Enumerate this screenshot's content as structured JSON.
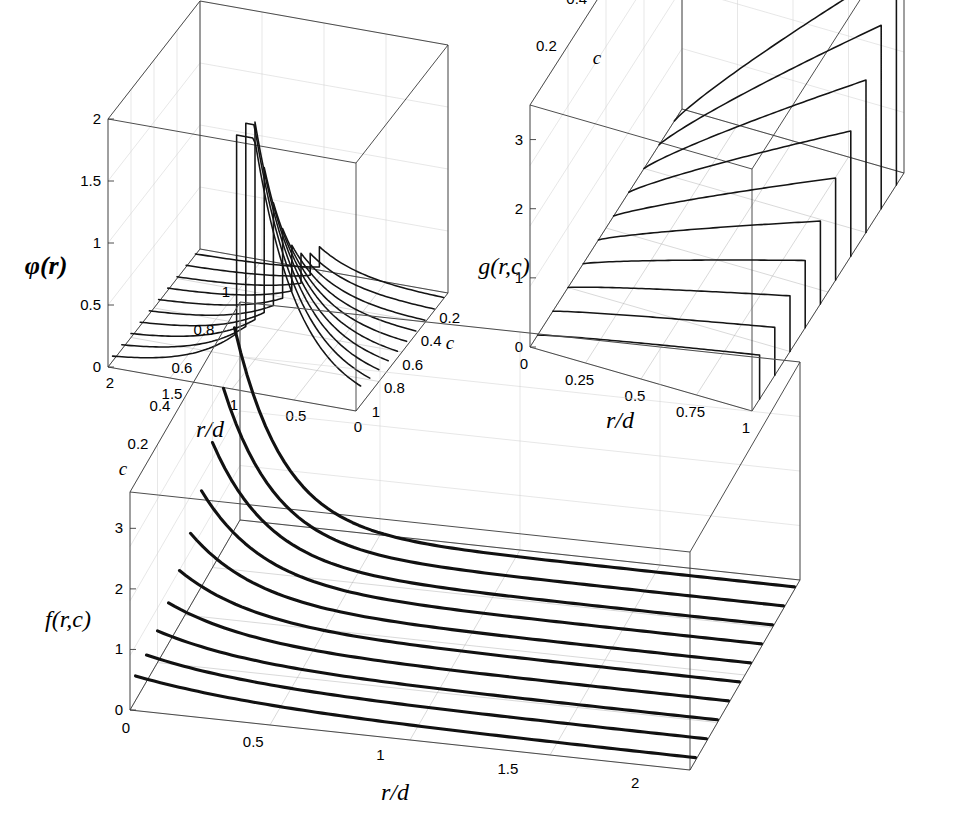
{
  "figure": {
    "kind": "three-panel-3d-line-plot",
    "background": "#ffffff",
    "curve_color": "#141414",
    "frame_color": "#3a3a3a",
    "grid_color": "#b9b9b9"
  },
  "chart_data": [
    {
      "id": "phi",
      "type": "line",
      "title": "",
      "zlabel": "φ(r)",
      "xlabel": "r/d",
      "ylabel": "c",
      "xticks": [
        "2",
        "1.5",
        "1",
        "0.5",
        "0"
      ],
      "xtickvals": [
        2,
        1.5,
        1,
        0.5,
        0
      ],
      "yticks": [
        "0.2",
        "0.4",
        "0.6",
        "0.8",
        "1"
      ],
      "ytickvals": [
        0.2,
        0.4,
        0.6,
        0.8,
        1
      ],
      "zticks": [
        "0",
        "0.5",
        "1",
        "1.5",
        "2"
      ],
      "ztickvals": [
        0,
        0.5,
        1,
        1.5,
        2
      ],
      "xlim": [
        0,
        2
      ],
      "ylim": [
        0,
        1
      ],
      "zlim": [
        0,
        2
      ],
      "x_reversed": true,
      "grid": true,
      "legend": "none",
      "series_param": "c",
      "series_values": [
        0.1,
        0.19,
        0.28,
        0.37,
        0.46,
        0.55,
        0.64,
        0.73,
        0.82,
        0.91
      ],
      "n_curves": 10,
      "note": "step discontinuity at r/d = 1; spike height grows with c"
    },
    {
      "id": "g",
      "type": "line",
      "title": "",
      "zlabel": "g(r,c)",
      "xlabel": "r/d",
      "ylabel": "c",
      "xticks": [
        "0",
        "0.25",
        "0.5",
        "0.75",
        "1"
      ],
      "xtickvals": [
        0,
        0.25,
        0.5,
        0.75,
        1
      ],
      "yticks": [
        "0.2",
        "0.4",
        "0.6",
        "0.8",
        "1"
      ],
      "ytickvals": [
        0.2,
        0.4,
        0.6,
        0.8,
        1
      ],
      "zticks": [
        "0",
        "1",
        "2",
        "3"
      ],
      "ztickvals": [
        0,
        1,
        2,
        3
      ],
      "xlim": [
        0,
        1
      ],
      "ylim": [
        0,
        1
      ],
      "zlim": [
        0,
        3.5
      ],
      "x_reversed": false,
      "grid": true,
      "legend": "none",
      "series_param": "c",
      "series_values": [
        0.1,
        0.19,
        0.28,
        0.37,
        0.46,
        0.55,
        0.64,
        0.73,
        0.82,
        0.91
      ],
      "n_curves": 10,
      "note": "curves rise from origin then drop vertically to 0 at r/d = 1"
    },
    {
      "id": "f",
      "type": "line",
      "title": "",
      "zlabel": "f(r,c)",
      "xlabel": "r/d",
      "ylabel": "c",
      "xticks": [
        "0",
        "0.5",
        "1",
        "1.5",
        "2"
      ],
      "xtickvals": [
        0,
        0.5,
        1,
        1.5,
        2
      ],
      "yticks": [
        "0.2",
        "0.4",
        "0.6",
        "0.8",
        "1"
      ],
      "ytickvals": [
        0.2,
        0.4,
        0.6,
        0.8,
        1
      ],
      "zticks": [
        "0",
        "1",
        "2",
        "3"
      ],
      "ztickvals": [
        0,
        1,
        2,
        3
      ],
      "xlim": [
        0,
        2.2
      ],
      "ylim": [
        0,
        1
      ],
      "zlim": [
        0,
        3.6
      ],
      "x_reversed": false,
      "grid": true,
      "legend": "none",
      "series_param": "c",
      "series_values": [
        0.1,
        0.19,
        0.28,
        0.37,
        0.46,
        0.55,
        0.64,
        0.73,
        0.82,
        0.91
      ],
      "n_curves": 10,
      "note": "monotonic decay, no discontinuity"
    }
  ],
  "panels": {
    "phi": {
      "zlabel": "φ(r)",
      "xlabel": "r/d",
      "ylabel": "c",
      "xticks": [
        "2",
        "1.5",
        "1",
        "0.5",
        "0"
      ],
      "yticks": [
        "0.2",
        "0.4",
        "0.6",
        "0.8",
        "1"
      ],
      "zticks": [
        "0",
        "0.5",
        "1",
        "1.5",
        "2"
      ]
    },
    "g": {
      "zlabel": "g(r,c)",
      "xlabel": "r/d",
      "ylabel": "c",
      "xticks": [
        "0",
        "0.25",
        "0.5",
        "0.75",
        "1"
      ],
      "yticks": [
        "0.2",
        "0.4",
        "0.6",
        "0.8",
        "1"
      ],
      "zticks": [
        "0",
        "1",
        "2",
        "3"
      ]
    },
    "f": {
      "zlabel": "f(r,c)",
      "xlabel": "r/d",
      "ylabel": "c",
      "xticks": [
        "0",
        "0.5",
        "1",
        "1.5",
        "2"
      ],
      "yticks": [
        "0.2",
        "0.4",
        "0.6",
        "0.8",
        "1"
      ],
      "zticks": [
        "0",
        "1",
        "2",
        "3"
      ]
    }
  }
}
